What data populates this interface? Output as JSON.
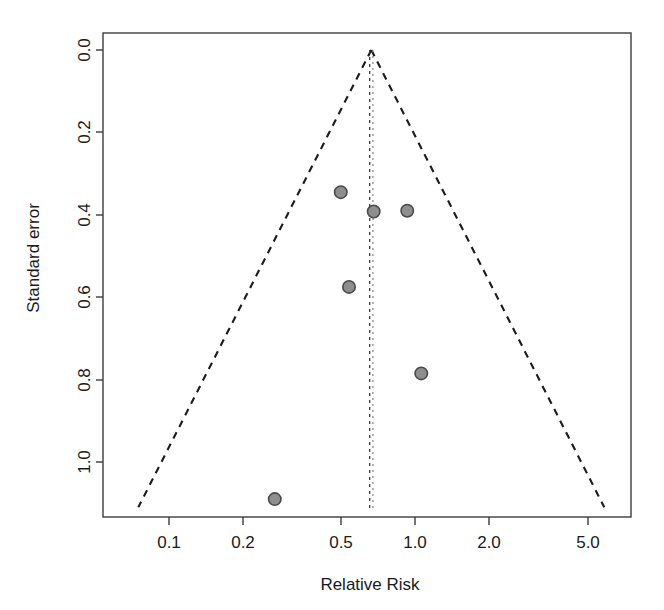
{
  "chart_data": {
    "type": "scatter",
    "plot_kind": "funnel-plot",
    "title": "",
    "xlabel": "Relative Risk",
    "ylabel": "Standard error",
    "x_scale": "log",
    "x_ticks": [
      0.1,
      0.2,
      0.5,
      1.0,
      2.0,
      5.0
    ],
    "x_tick_labels": [
      "0.1",
      "0.2",
      "0.5",
      "1.0",
      "2.0",
      "5.0"
    ],
    "xlim": [
      0.0555,
      6.2
    ],
    "y_ticks": [
      0.0,
      0.2,
      0.4,
      0.6,
      0.8,
      1.0
    ],
    "y_tick_labels": [
      "0.0",
      "0.2",
      "0.4",
      "0.6",
      "0.8",
      "1.0"
    ],
    "ylim": [
      1.135,
      -0.04
    ],
    "y_inverted": true,
    "grid": false,
    "legend": null,
    "points": [
      {
        "x": 0.5,
        "y": 0.345
      },
      {
        "x": 0.68,
        "y": 0.392
      },
      {
        "x": 0.93,
        "y": 0.39
      },
      {
        "x": 0.54,
        "y": 0.575
      },
      {
        "x": 1.06,
        "y": 0.785
      },
      {
        "x": 0.27,
        "y": 1.09
      }
    ],
    "reference_lines": [
      {
        "name": "pooled-effect-solid",
        "x": 0.655,
        "style": "dashed"
      },
      {
        "name": "pooled-effect-dotted",
        "x": 0.675,
        "style": "dotted"
      }
    ],
    "funnel": {
      "center": 0.665,
      "z": 1.96,
      "apex_y": 0.0,
      "base_y": 1.11,
      "style": "dashed"
    }
  },
  "axes": {
    "x_title": "Relative Risk",
    "y_title": "Standard error"
  },
  "colors": {
    "point_fill": "#8e8e8e",
    "point_stroke": "#4a4a4a",
    "axis": "#3c3c3c",
    "funnel": "#1b1b1b",
    "background": "#ffffff"
  }
}
